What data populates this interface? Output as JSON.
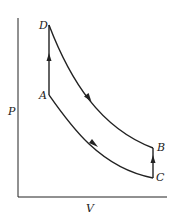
{
  "diagram": {
    "type": "P-V cycle diagram",
    "axes": {
      "ylabel": "P",
      "xlabel": "V"
    },
    "points": {
      "A": "A",
      "B": "B",
      "C": "C",
      "D": "D"
    },
    "paths": [
      {
        "from": "A",
        "to": "D",
        "kind": "vertical",
        "arrow": "up"
      },
      {
        "from": "D",
        "to": "B",
        "kind": "curve",
        "arrow": "down-right"
      },
      {
        "from": "C",
        "to": "B",
        "kind": "vertical",
        "arrow": "up"
      },
      {
        "from": "A",
        "to": "C",
        "kind": "curve",
        "arrow": "down-right"
      }
    ],
    "colors": {
      "line": "#222222",
      "background": "#ffffff"
    }
  }
}
